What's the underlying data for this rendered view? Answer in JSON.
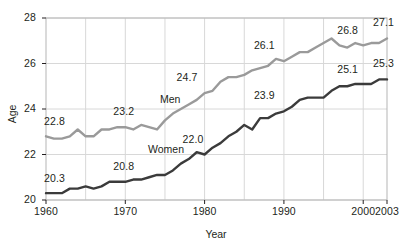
{
  "chart_data": {
    "type": "line",
    "title": "",
    "subtitle": "",
    "xlabel": "Year",
    "ylabel": "Age",
    "xlim": [
      1960,
      2003
    ],
    "ylim": [
      20,
      28
    ],
    "yticks": [
      "20",
      "22",
      "24",
      "26",
      "28"
    ],
    "xticks": [
      "1960",
      "1970",
      "1980",
      "1990",
      "2000",
      "2003"
    ],
    "grid": true,
    "legend_position": "inline-labels",
    "colors": {
      "men": "#9a9a9a",
      "women": "#3b3b3b",
      "grid": "#d8d8d8",
      "axis": "#b5b5b5",
      "text": "#231f20",
      "background": "#ffffff"
    },
    "x": [
      1960,
      1961,
      1962,
      1963,
      1964,
      1965,
      1966,
      1967,
      1968,
      1969,
      1970,
      1971,
      1972,
      1973,
      1974,
      1975,
      1976,
      1977,
      1978,
      1979,
      1980,
      1981,
      1982,
      1983,
      1984,
      1985,
      1986,
      1987,
      1988,
      1989,
      1990,
      1991,
      1992,
      1993,
      1994,
      1995,
      1996,
      1997,
      1998,
      1999,
      2000,
      2001,
      2002,
      2003
    ],
    "series": [
      {
        "name": "Men",
        "color": "#9a9a9a",
        "values": [
          22.8,
          22.7,
          22.7,
          22.8,
          23.1,
          22.8,
          22.8,
          23.1,
          23.1,
          23.2,
          23.2,
          23.1,
          23.3,
          23.2,
          23.1,
          23.5,
          23.8,
          24.0,
          24.2,
          24.4,
          24.7,
          24.8,
          25.2,
          25.4,
          25.4,
          25.5,
          25.7,
          25.8,
          25.9,
          26.2,
          26.1,
          26.3,
          26.5,
          26.5,
          26.7,
          26.9,
          27.1,
          26.8,
          26.7,
          26.9,
          26.8,
          26.9,
          26.9,
          27.1
        ]
      },
      {
        "name": "Women",
        "color": "#3b3b3b",
        "values": [
          20.3,
          20.3,
          20.3,
          20.5,
          20.5,
          20.6,
          20.5,
          20.6,
          20.8,
          20.8,
          20.8,
          20.9,
          20.9,
          21.0,
          21.1,
          21.1,
          21.3,
          21.6,
          21.8,
          22.1,
          22.0,
          22.3,
          22.5,
          22.8,
          23.0,
          23.3,
          23.1,
          23.6,
          23.6,
          23.8,
          23.9,
          24.1,
          24.4,
          24.5,
          24.5,
          24.5,
          24.8,
          25.0,
          25.0,
          25.1,
          25.1,
          25.1,
          25.3,
          25.3
        ]
      }
    ],
    "annotations": [
      {
        "text": "22.8",
        "series": "Men",
        "x": 1960,
        "value": 22.8
      },
      {
        "text": "23.2",
        "series": "Men",
        "x": 1970,
        "value": 23.2
      },
      {
        "text": "24.7",
        "series": "Men",
        "x": 1980,
        "value": 24.7
      },
      {
        "text": "26.1",
        "series": "Men",
        "x": 1990,
        "value": 26.1
      },
      {
        "text": "26.8",
        "series": "Men",
        "x": 2000,
        "value": 26.8
      },
      {
        "text": "27.1",
        "series": "Men",
        "x": 2003,
        "value": 27.1
      },
      {
        "text": "20.3",
        "series": "Women",
        "x": 1960,
        "value": 20.3
      },
      {
        "text": "20.8",
        "series": "Women",
        "x": 1970,
        "value": 20.8
      },
      {
        "text": "22.0",
        "series": "Women",
        "x": 1980,
        "value": 22.0
      },
      {
        "text": "23.9",
        "series": "Women",
        "x": 1990,
        "value": 23.9
      },
      {
        "text": "25.1",
        "series": "Women",
        "x": 2000,
        "value": 25.1
      },
      {
        "text": "25.3",
        "series": "Women",
        "x": 2003,
        "value": 25.3
      }
    ],
    "series_labels": [
      {
        "text": "Men"
      },
      {
        "text": "Women"
      }
    ]
  }
}
